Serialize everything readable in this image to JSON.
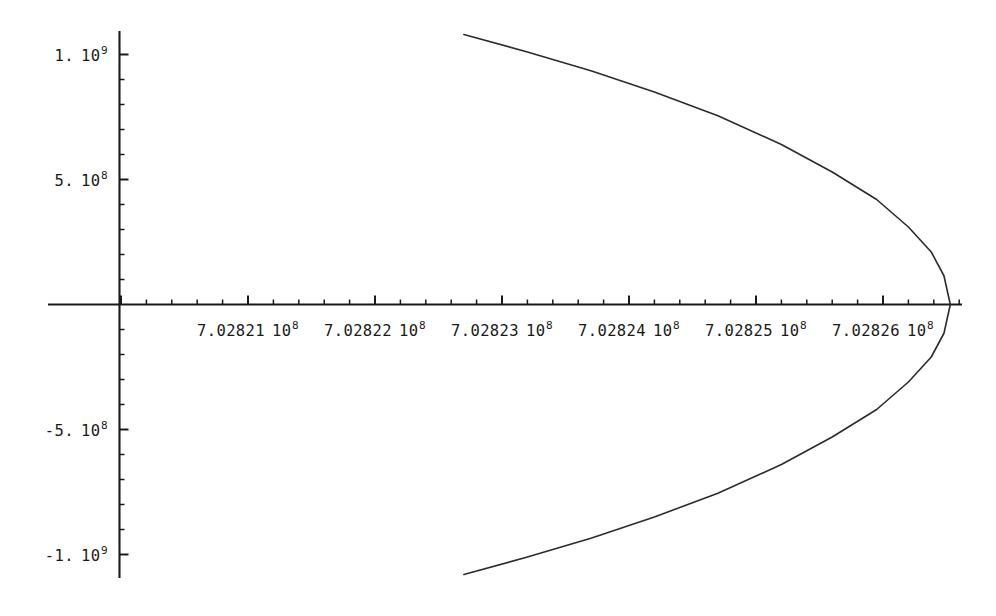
{
  "chart_data": {
    "type": "line",
    "title": "",
    "xlabel": "",
    "ylabel": "",
    "grid": false,
    "legend": null,
    "xlim": [
      702820600,
      702826600
    ],
    "ylim": [
      -1120000000.0,
      1120000000.0
    ],
    "x_ticks": [
      {
        "value": 702821000,
        "mantissa": "7.02821",
        "base": "10",
        "exp": "8",
        "label": "7.02821 10^8"
      },
      {
        "value": 702822000,
        "mantissa": "7.02822",
        "base": "10",
        "exp": "8",
        "label": "7.02822 10^8"
      },
      {
        "value": 702823000,
        "mantissa": "7.02823",
        "base": "10",
        "exp": "8",
        "label": "7.02823 10^8"
      },
      {
        "value": 702824000,
        "mantissa": "7.02824",
        "base": "10",
        "exp": "8",
        "label": "7.02824 10^8"
      },
      {
        "value": 702825000,
        "mantissa": "7.02825",
        "base": "10",
        "exp": "8",
        "label": "7.02825 10^8"
      },
      {
        "value": 702826000,
        "mantissa": "7.02826",
        "base": "10",
        "exp": "8",
        "label": "7.02826 10^8"
      }
    ],
    "y_ticks": [
      {
        "value": 1000000000,
        "mantissa": "1.",
        "base": "10",
        "exp": "9",
        "label": "1. 10^9"
      },
      {
        "value": 500000000,
        "mantissa": "5.",
        "base": "10",
        "exp": "8",
        "label": "5. 10^8"
      },
      {
        "value": -500000000,
        "mantissa": "-5.",
        "base": "10",
        "exp": "8",
        "label": "-5. 10^8"
      },
      {
        "value": -1000000000,
        "mantissa": "-1.",
        "base": "10",
        "exp": "9",
        "label": "-1. 10^9"
      }
    ],
    "x_minor_ticks_per_major": 5,
    "y_minor_ticks_per_major": 5,
    "series": [
      {
        "name": "parabola-upper",
        "x": [
          702822700,
          702823200,
          702823700,
          702824200,
          702824700,
          702825200,
          702825600,
          702825950,
          702826200,
          702826380,
          702826480,
          702826530
        ],
        "y": [
          1080000000,
          1010000000,
          935000000,
          850000000,
          755000000,
          640000000,
          530000000,
          420000000,
          310000000,
          210000000,
          115000000,
          0
        ]
      },
      {
        "name": "parabola-lower",
        "x": [
          702822700,
          702823200,
          702823700,
          702824200,
          702824700,
          702825200,
          702825600,
          702825950,
          702826200,
          702826380,
          702826480,
          702826530
        ],
        "y": [
          -1080000000,
          -1010000000,
          -935000000,
          -850000000,
          -755000000,
          -640000000,
          -530000000,
          -420000000,
          -310000000,
          -210000000,
          -115000000,
          0
        ]
      }
    ],
    "colors": {
      "background": "#ffffff",
      "axis": "#1a1a1a",
      "curve": "#2b2b2b",
      "text": "#1a1a1a"
    }
  }
}
